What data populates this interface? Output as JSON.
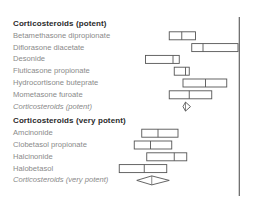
{
  "chart_data": {
    "type": "forest",
    "title": "",
    "xlabel": "",
    "ylabel": "",
    "x_range": [
      0,
      100
    ],
    "reference_line_x": 97,
    "groups": [
      {
        "heading": "Corticosteroids  (potent)",
        "studies": [
          {
            "name": "Betamethasone dipropionate",
            "lower": 41,
            "estimate": 51,
            "upper": 62
          },
          {
            "name": "Diflorasone diacetate",
            "lower": 59,
            "estimate": 68,
            "upper": 96
          },
          {
            "name": "Desonide",
            "lower": 22,
            "estimate": 44,
            "upper": 49
          },
          {
            "name": "Fluticasone propionate",
            "lower": 45,
            "estimate": 54,
            "upper": 57
          },
          {
            "name": "Hydrocortisone buteprate",
            "lower": 52,
            "estimate": 70,
            "upper": 87
          },
          {
            "name": "Mometasone furoate",
            "lower": 41,
            "estimate": 57,
            "upper": 75
          }
        ],
        "pooled": {
          "name": "Corticosteroids (potent)",
          "lower": 52,
          "estimate": 54,
          "upper": 58
        }
      },
      {
        "heading": "Corticosteroids  (very potent)",
        "studies": [
          {
            "name": "Amcinonide",
            "lower": 19,
            "estimate": 32,
            "upper": 48
          },
          {
            "name": "Clobetasol propionate",
            "lower": 13,
            "estimate": 26,
            "upper": 43
          },
          {
            "name": "Halcinonide",
            "lower": 23,
            "estimate": 45,
            "upper": 55
          },
          {
            "name": "Halobetasol",
            "lower": 1,
            "estimate": 21,
            "upper": 39
          },
          {
            "name": "Corticosteroids (very potent)",
            "pooled_marker": true
          }
        ],
        "pooled": {
          "name": "Corticosteroids (very potent)",
          "lower": 15,
          "estimate": 27,
          "upper": 41
        }
      }
    ]
  }
}
